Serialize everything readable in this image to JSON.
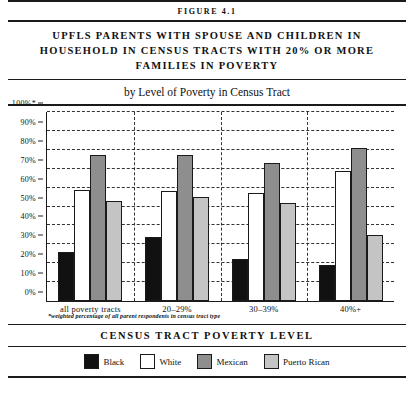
{
  "figure": {
    "number_label": "FIGURE 4.1",
    "title": "UPFLS PARENTS WITH SPOUSE AND CHILDREN IN HOUSEHOLD IN CENSUS TRACTS WITH 20% OR MORE FAMILIES IN POVERTY",
    "subtitle": "by Level of Poverty in Census Tract",
    "axis_caption": "CENSUS TRACT POVERTY LEVEL",
    "footnote": "*weighted percentage of all parent respondents in census tract type"
  },
  "chart_data": {
    "type": "bar",
    "title": "UPFLS PARENTS WITH SPOUSE AND CHILDREN IN HOUSEHOLD IN CENSUS TRACTS WITH 20% OR MORE FAMILIES IN POVERTY",
    "subtitle": "by Level of Poverty in Census Tract",
    "xlabel": "CENSUS TRACT POVERTY LEVEL",
    "ylabel": "",
    "ylim": [
      0,
      100
    ],
    "grid": true,
    "legend_position": "bottom",
    "categories": [
      "all poverty tracts",
      "20–29%",
      "30–39%",
      "40%+"
    ],
    "ticks": [
      "0%",
      "10%",
      "20%",
      "30%",
      "40%",
      "50%",
      "60%",
      "70%",
      "80%",
      "90%",
      "100%*"
    ],
    "series": [
      {
        "name": "Black",
        "color": "#111111",
        "values": [
          26,
          34,
          22,
          19
        ]
      },
      {
        "name": "White",
        "color": "#ffffff",
        "values": [
          59,
          58,
          57,
          69
        ]
      },
      {
        "name": "Mexican",
        "color": "#8e8e8e",
        "values": [
          77,
          77,
          73,
          81
        ]
      },
      {
        "name": "Puerto Rican",
        "color": "#c4c4c4",
        "values": [
          53,
          55,
          52,
          35
        ]
      }
    ]
  }
}
